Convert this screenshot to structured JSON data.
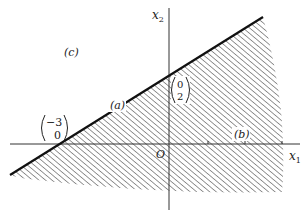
{
  "figure": {
    "panel_label": "(c)",
    "axes": {
      "x_label": "x",
      "x_sub": "1",
      "y_label": "x",
      "y_sub": "2",
      "origin_label": "O"
    },
    "line_label": "(a)",
    "region_label": "(b)",
    "points": [
      {
        "name": "x-intercept",
        "top": "−3",
        "bottom": "0"
      },
      {
        "name": "y-intercept",
        "top": "0",
        "bottom": "2"
      }
    ],
    "colors": {
      "line": "#111111",
      "hatch": "#444444",
      "axis": "#333333",
      "background": "#ffffff"
    }
  }
}
